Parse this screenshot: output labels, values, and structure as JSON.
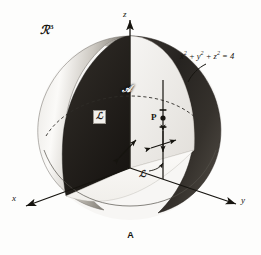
{
  "figure": {
    "caption": "A",
    "space_label": "ℛ",
    "space_exponent": "3",
    "surface_equation_parts": {
      "x": "x",
      "y": "y",
      "z": "z",
      "exp": "2",
      "plus1": "+",
      "plus2": "+",
      "equals": "=",
      "rhs": "4"
    },
    "surface_equation_plain": "x² + y² + z² = 4"
  },
  "axes": {
    "z_label": "z",
    "x_label": "x",
    "y_label": "y"
  },
  "annotations": {
    "region_A": "𝒜",
    "region_L_boxed": "ℒ",
    "line_L": "ℒ",
    "point_P": "P"
  },
  "colors": {
    "background": "#fdfdfc",
    "ink": "#16140f",
    "shell_light": "#f4f2ef",
    "shell_mid": "#b9b5ae",
    "shell_dark": "#2a2723",
    "interior_dark": "#201d1a",
    "outline": "#4a463f"
  }
}
